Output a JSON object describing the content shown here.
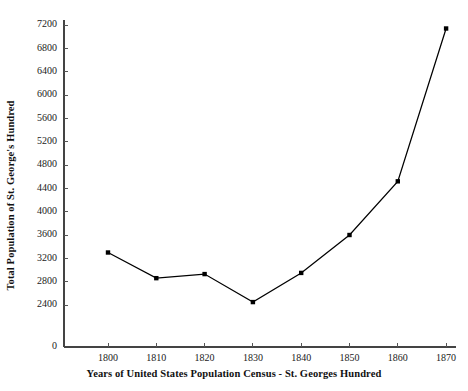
{
  "chart_data": {
    "type": "line",
    "title": "",
    "xlabel": "Years of United States Population Census - St. Georges Hundred",
    "ylabel": "Total Population of St. George's Hundred",
    "categories": [
      1800,
      1810,
      1820,
      1830,
      1840,
      1850,
      1860,
      1870
    ],
    "x_tick_labels": [
      "1800",
      "1810",
      "1820",
      "1830",
      "1840",
      "1850",
      "1860",
      "1870"
    ],
    "values": [
      3300,
      2860,
      2930,
      2450,
      2950,
      3600,
      4520,
      7140
    ],
    "series": [
      {
        "name": "Total Population of St. George's Hundred",
        "values": [
          3300,
          2860,
          2930,
          2450,
          2950,
          3600,
          4520,
          7140
        ]
      }
    ],
    "y_tick_labels": [
      "0",
      "2400",
      "2800",
      "3200",
      "3600",
      "4000",
      "4400",
      "4800",
      "5200",
      "5600",
      "6000",
      "6400",
      "6800",
      "7200"
    ],
    "y_tick_values": [
      0,
      2400,
      2800,
      3200,
      3600,
      4000,
      4400,
      4800,
      5200,
      5600,
      6000,
      6400,
      6800,
      7200
    ],
    "ylim": [
      2400,
      7200
    ],
    "xlim": [
      1795,
      1875
    ],
    "axis_break_below": 2400,
    "grid": false,
    "legend": false,
    "marker": "square",
    "line_color": "#000000",
    "marker_color": "#000000",
    "background_color": "#ffffff"
  }
}
